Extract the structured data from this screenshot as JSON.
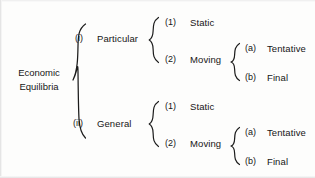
{
  "diagram": {
    "root": {
      "line1": "Economic",
      "line2": "Equilibria"
    },
    "level1": [
      {
        "marker": "(i)",
        "label": "Particular"
      },
      {
        "marker": "(ii)",
        "label": "General"
      }
    ],
    "level2": [
      {
        "marker": "(1)",
        "label": "Static"
      },
      {
        "marker": "(2)",
        "label": "Moving"
      },
      {
        "marker": "(1)",
        "label": "Static"
      },
      {
        "marker": "(2)",
        "label": "Moving"
      }
    ],
    "level3": [
      {
        "marker": "(a)",
        "label": "Tentative"
      },
      {
        "marker": "(b)",
        "label": "Final"
      },
      {
        "marker": "(a)",
        "label": "Tentative"
      },
      {
        "marker": "(b)",
        "label": "Final"
      }
    ],
    "braces": {
      "root_brace": "{",
      "branch_brace": "{",
      "leaf_brace": "{"
    },
    "colors": {
      "ink": "#161616",
      "paper": "#fdfdfc"
    }
  }
}
